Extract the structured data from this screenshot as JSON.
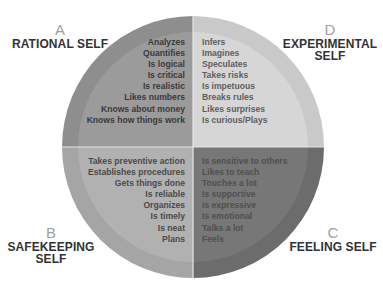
{
  "diagram": {
    "center": {
      "x": 193,
      "y": 147
    },
    "radius": 131,
    "ring_width": 16,
    "quadrants": [
      {
        "id": "A",
        "letter": "A",
        "title_lines": [
          "RATIONAL SELF"
        ],
        "position": "top-left",
        "colors": {
          "ring": "#8e8e8e",
          "inner": "#9b9b9b"
        },
        "traits": [
          "Analyzes",
          "Quantifies",
          "Is logical",
          "Is critical",
          "Is realistic",
          "Likes numbers",
          "Knows about money",
          "Knows how things work"
        ]
      },
      {
        "id": "D",
        "letter": "D",
        "title_lines": [
          "EXPERIMENTAL",
          "SELF"
        ],
        "position": "top-right",
        "colors": {
          "ring": "#c9c9c9",
          "inner": "#d6d6d6"
        },
        "traits": [
          "Infers",
          "Imagines",
          "Speculates",
          "Takes risks",
          "Is impetuous",
          "Breaks rules",
          "Likes surprises",
          "Is curious/Plays"
        ]
      },
      {
        "id": "B",
        "letter": "B",
        "title_lines": [
          "SAFEKEEPING",
          "SELF"
        ],
        "position": "bottom-left",
        "colors": {
          "ring": "#a5a5a5",
          "inner": "#b1b1b1"
        },
        "traits": [
          "Takes preventive action",
          "Establishes procedures",
          "Gets things done",
          "Is reliable",
          "Organizes",
          "Is timely",
          "Is neat",
          "Plans"
        ]
      },
      {
        "id": "C",
        "letter": "C",
        "title_lines": [
          "FEELING SELF"
        ],
        "position": "bottom-right",
        "colors": {
          "ring": "#6c6c6c",
          "inner": "#777777"
        },
        "traits": [
          "Is sensitive to others",
          "Likes to teach",
          "Touches a lot",
          "Is supportive",
          "Is expressive",
          "Is emotional",
          "Talks a lot",
          "Feels"
        ]
      }
    ],
    "divider_color": "#e6e6e6"
  }
}
